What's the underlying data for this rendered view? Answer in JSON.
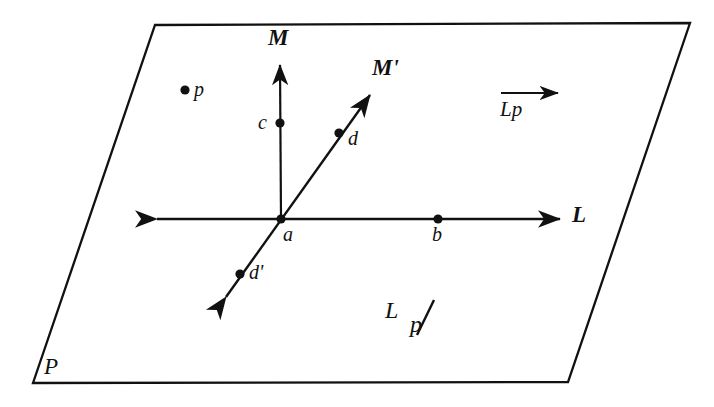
{
  "figure": {
    "type": "geometry-diagram",
    "background_color": "#ffffff",
    "ink_color": "#111111",
    "width": 714,
    "height": 407,
    "plane": {
      "label": "P",
      "label_x": 44,
      "label_y": 355,
      "corners": [
        {
          "x": 155,
          "y": 25
        },
        {
          "x": 690,
          "y": 23
        },
        {
          "x": 568,
          "y": 382
        },
        {
          "x": 33,
          "y": 383
        }
      ]
    },
    "lines": [
      {
        "name": "line-L",
        "label": "L",
        "label_x": 572,
        "label_y": 203,
        "from_x": 157,
        "from_y": 219,
        "to_x": 560,
        "to_y": 219,
        "arrow_start": true,
        "arrow_end": true
      },
      {
        "name": "line-M",
        "label": "M",
        "label_x": 268,
        "label_y": 26,
        "from_x": 281,
        "from_y": 219,
        "to_x": 280,
        "to_y": 65,
        "arrow_start": false,
        "arrow_end": true
      },
      {
        "name": "line-M-prime",
        "label": "M'",
        "label_x": 372,
        "label_y": 56,
        "from_x": 226,
        "from_y": 297,
        "to_x": 370,
        "to_y": 95,
        "arrow_start": true,
        "arrow_end": true
      }
    ],
    "points": [
      {
        "name": "point-p",
        "label": "p",
        "x": 185,
        "y": 90,
        "label_x": 194,
        "label_y": 79
      },
      {
        "name": "point-c",
        "label": "c",
        "x": 280,
        "y": 123,
        "label_x": 258,
        "label_y": 112
      },
      {
        "name": "point-a",
        "label": "a",
        "x": 281,
        "y": 219,
        "label_x": 283,
        "label_y": 224
      },
      {
        "name": "point-b",
        "label": "b",
        "x": 438,
        "y": 219,
        "label_x": 432,
        "label_y": 224
      },
      {
        "name": "point-d",
        "label": "d",
        "x": 339,
        "y": 133,
        "label_x": 348,
        "label_y": 128
      },
      {
        "name": "point-d-prime",
        "label": "d'",
        "x": 240,
        "y": 274,
        "label_x": 249,
        "label_y": 262
      }
    ],
    "annotations": {
      "vector_lp": {
        "name": "vector-lp-label",
        "text": "Lp",
        "x": 500,
        "y": 85,
        "arrow_width": 58
      },
      "quotient": {
        "name": "quotient-l-mod-p-label",
        "numerator": "L",
        "slash": "/",
        "denominator": "p",
        "x": 385,
        "y": 298
      }
    }
  }
}
